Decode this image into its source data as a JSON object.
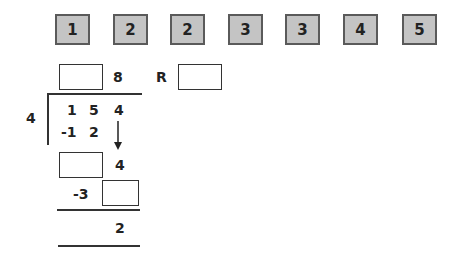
{
  "tiles": [
    "1",
    "2",
    "2",
    "3",
    "3",
    "4",
    "5"
  ],
  "division": {
    "divisor": "4",
    "dividend": [
      "1",
      "5",
      "4"
    ],
    "quotient_known_digit": "8",
    "remainder_label": "R",
    "step1_subtract": [
      "-1",
      "2"
    ],
    "bring_down": "4",
    "step2_subtract_lead": "-3",
    "final_remainder": "2"
  }
}
